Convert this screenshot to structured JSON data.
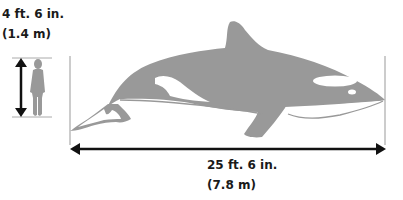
{
  "human": {
    "height_ft": "4 ft. 6 in.",
    "height_m": "(1.4 m)",
    "icon": "human-silhouette-icon"
  },
  "whale": {
    "length_ft": "25 ft. 6 in.",
    "length_m": "(7.8 m)",
    "icon": "orca-silhouette-icon"
  },
  "colors": {
    "silhouette": "#999999",
    "arrow": "#111111",
    "guide_line": "#aaaaaa",
    "background": "#ffffff"
  }
}
